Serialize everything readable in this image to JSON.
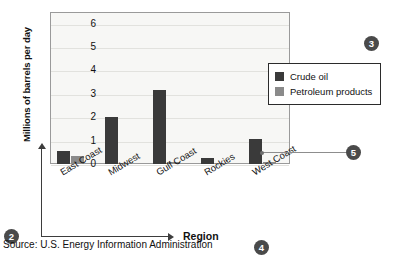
{
  "chart_data": {
    "type": "bar",
    "title": "",
    "xlabel": "Region",
    "ylabel": "Millions of barrels per day",
    "categories": [
      "East Coast",
      "Midwest",
      "Gulf Coast",
      "Rockies",
      "West Coast"
    ],
    "series": [
      {
        "name": "Crude oil",
        "color": "#3a3a3a",
        "values": [
          0.55,
          2.0,
          3.15,
          0.25,
          1.05
        ]
      },
      {
        "name": "Petroleum products",
        "color": "#8a8a8a",
        "values": [
          0.35,
          0.05,
          0.08,
          0.03,
          0.07
        ]
      }
    ],
    "ylim": [
      0,
      6.5
    ],
    "yticks": [
      "0",
      "1",
      "2",
      "3",
      "4",
      "5",
      "6"
    ],
    "grid": true,
    "legend_position": "right"
  },
  "legend": {
    "items": [
      {
        "label": "Crude oil",
        "color": "#3a3a3a"
      },
      {
        "label": "Petroleum products",
        "color": "#8a8a8a"
      }
    ]
  },
  "markers": {
    "m2": "2",
    "m3": "3",
    "m4": "4",
    "m5": "5"
  },
  "source": {
    "text": "Source: U.S. Energy Information Administration"
  }
}
